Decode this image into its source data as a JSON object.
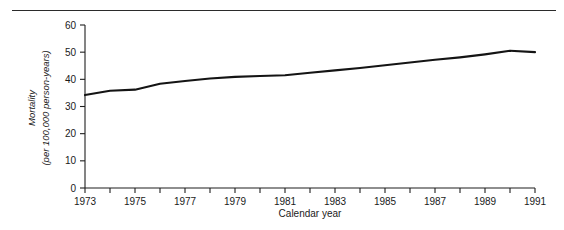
{
  "figure": {
    "has_top_rule": true,
    "background_color": "#ffffff",
    "line_color": "#141414",
    "axis_color": "#1f1f1f"
  },
  "chart_data": {
    "type": "line",
    "title": "",
    "subtitle": "",
    "xlabel": "Calendar year",
    "ylabel_line1": "Mortality",
    "ylabel_line2": "(per 100,000 person-years)",
    "ylabel": "Mortality (per 100,000 person-years)",
    "x": [
      1973,
      1974,
      1975,
      1976,
      1977,
      1978,
      1979,
      1980,
      1981,
      1982,
      1983,
      1984,
      1985,
      1986,
      1987,
      1988,
      1989,
      1990,
      1991
    ],
    "values": [
      34.2,
      35.8,
      36.2,
      38.4,
      39.4,
      40.3,
      40.9,
      41.2,
      41.5,
      42.4,
      43.3,
      44.2,
      45.2,
      46.2,
      47.2,
      48.1,
      49.2,
      50.5,
      50.0
    ],
    "series": [
      {
        "name": "Mortality",
        "values": [
          34.2,
          35.8,
          36.2,
          38.4,
          39.4,
          40.3,
          40.9,
          41.2,
          41.5,
          42.4,
          43.3,
          44.2,
          45.2,
          46.2,
          47.2,
          48.1,
          49.2,
          50.5,
          50.0
        ]
      }
    ],
    "xlim": [
      1973,
      1991
    ],
    "ylim": [
      0,
      60
    ],
    "xticks": [
      1973,
      1974,
      1975,
      1976,
      1977,
      1978,
      1979,
      1980,
      1981,
      1982,
      1983,
      1984,
      1985,
      1986,
      1987,
      1988,
      1989,
      1990,
      1991
    ],
    "xtick_labels": [
      "1973",
      "",
      "1975",
      "",
      "1977",
      "",
      "1979",
      "",
      "1981",
      "",
      "1983",
      "",
      "1985",
      "",
      "1987",
      "",
      "1989",
      "",
      "1991"
    ],
    "yticks": [
      0,
      10,
      20,
      30,
      40,
      50,
      60
    ],
    "ytick_labels": [
      "0",
      "10",
      "20",
      "30",
      "40",
      "50",
      "60"
    ],
    "grid": false,
    "legend": false,
    "legend_position": "none"
  },
  "axes": {
    "y_labels": [
      "60",
      "50",
      "40",
      "30",
      "20",
      "10",
      "0"
    ],
    "x_labels": [
      "1973",
      "1975",
      "1977",
      "1979",
      "1981",
      "1983",
      "1985",
      "1987",
      "1989",
      "1991"
    ]
  }
}
